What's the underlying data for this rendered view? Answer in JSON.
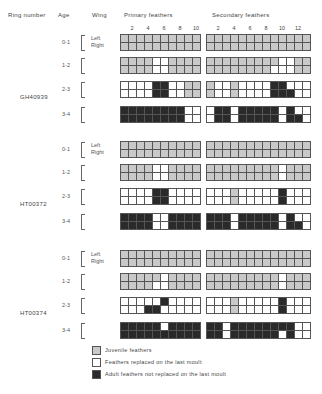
{
  "headers": {
    "ring_number": "Ring number",
    "age": "Age",
    "wing": "Wing",
    "primary": "Primary feathers",
    "secondary": "Secondary feathers"
  },
  "primary_ticks": [
    "2",
    "4",
    "6",
    "8",
    "10"
  ],
  "secondary_ticks": [
    "2",
    "4",
    "6",
    "8",
    "10",
    "12"
  ],
  "wing_labels": {
    "left": "Left",
    "right": "Right"
  },
  "colors": {
    "juvenile": "#c9c9c9",
    "replaced": "#ffffff",
    "not_replaced": "#2a2a2a"
  },
  "legend": [
    {
      "key": "g",
      "label": "Juvenile feathers"
    },
    {
      "key": "w",
      "label": "Feathers replaced on the last moult"
    },
    {
      "key": "b",
      "label": "Adult feathers not replaced on the last moult"
    }
  ],
  "birds": [
    {
      "ring": "GH40939",
      "ages": [
        {
          "age": "0-1",
          "primary": [
            "gggggggggg",
            "gggggggggg"
          ],
          "secondary": [
            "ggggggggggggg",
            "ggggggggggggg"
          ]
        },
        {
          "age": "1-2",
          "primary": [
            "ggggwwgggg",
            "ggggwwgggg"
          ],
          "secondary": [
            "gggggggggwwgg",
            "ggggggggwwwgg"
          ]
        },
        {
          "age": "2-3",
          "primary": [
            "wwwwbbwwgg",
            "wwwwbbwwgg"
          ],
          "secondary": [
            "gwwgwwwwbbwww",
            "gwwgwwwwbbbww"
          ]
        },
        {
          "age": "3-4",
          "primary": [
            "bbbbbbbbww",
            "bbbbbbbbww"
          ],
          "secondary": [
            "wbbwbbbbbwbww",
            "wbbwbbbbbwbbw"
          ]
        }
      ]
    },
    {
      "ring": "HT00372",
      "ages": [
        {
          "age": "0-1",
          "primary": [
            "gggggggggg",
            "gggggggggg"
          ],
          "secondary": [
            "ggggggggggggg",
            "ggggggggggggg"
          ]
        },
        {
          "age": "1-2",
          "primary": [
            "ggggwwgggg",
            "ggggwwgggg"
          ],
          "secondary": [
            "gggggggggwggg",
            "gggggggggwggg"
          ]
        },
        {
          "age": "2-3",
          "primary": [
            "wwwwbbwwww",
            "wwwwbbwwww"
          ],
          "secondary": [
            "wwwgwwwwwbwww",
            "wwwgwwwwwbwww"
          ]
        },
        {
          "age": "3-4",
          "primary": [
            "bbbbwwbbbb",
            "bbbbwwbbbb"
          ],
          "secondary": [
            "bbbwbbbbbwbww",
            "bbbwbbbbbwbbw"
          ]
        }
      ]
    },
    {
      "ring": "HT00374",
      "ages": [
        {
          "age": "0-1",
          "primary": [
            "gggggggggg",
            "gggggggggg"
          ],
          "secondary": [
            "ggggggggggggg",
            "ggggggggggggg"
          ]
        },
        {
          "age": "1-2",
          "primary": [
            "gggggwgggg",
            "ggggwwgggg"
          ],
          "secondary": [
            "gggggggggwggg",
            "gggggggggwggg"
          ]
        },
        {
          "age": "2-3",
          "primary": [
            "wwwwwbwwww",
            "wwwbbwwwww"
          ],
          "secondary": [
            "wwwgwwwwwbwww",
            "wwwgwwwwwbwww"
          ]
        },
        {
          "age": "3-4",
          "primary": [
            "bbbbbwbbbb",
            "bbbbbbbbbb"
          ],
          "secondary": [
            "bbwbbbbbbbbww",
            "bbwbbbbbbwbww"
          ]
        }
      ]
    }
  ]
}
